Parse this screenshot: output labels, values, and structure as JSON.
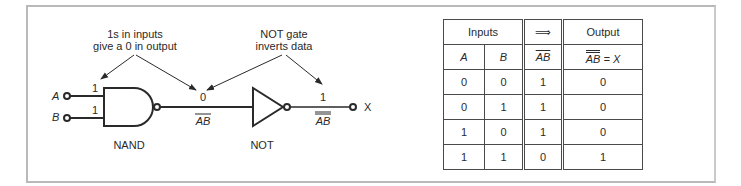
{
  "diagram": {
    "annotations": {
      "nand_note_line1": "1s in inputs",
      "nand_note_line2": "give a 0 in output",
      "not_note_line1": "NOT gate",
      "not_note_line2": "inverts data"
    },
    "inputs": {
      "a_label": "A",
      "b_label": "B",
      "a_value": "1",
      "b_value": "1"
    },
    "nand": {
      "label": "NAND",
      "output_value": "0",
      "output_expr": "AB"
    },
    "not": {
      "label": "NOT",
      "output_value": "1",
      "output_expr": "AB"
    },
    "output_label": "X"
  },
  "truth_table": {
    "header_inputs": "Inputs",
    "header_arrow": "⟹",
    "header_output": "Output",
    "col_a": "A",
    "col_b": "B",
    "col_nand": "AB",
    "col_out_expr": "AB",
    "col_out_eq": " = X",
    "rows": [
      {
        "a": "0",
        "b": "0",
        "nand": "1",
        "out": "0"
      },
      {
        "a": "0",
        "b": "1",
        "nand": "1",
        "out": "0"
      },
      {
        "a": "1",
        "b": "0",
        "nand": "1",
        "out": "0"
      },
      {
        "a": "1",
        "b": "1",
        "nand": "0",
        "out": "1"
      }
    ]
  }
}
